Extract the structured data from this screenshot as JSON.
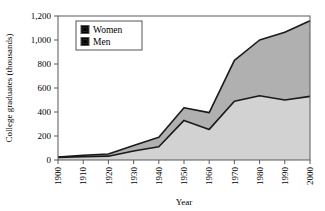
{
  "chart_data": {
    "type": "area",
    "stacked": true,
    "title": "",
    "xlabel": "Year",
    "ylabel": "College graduates (thousands)",
    "categories": [
      1900,
      1910,
      1920,
      1930,
      1940,
      1950,
      1960,
      1970,
      1980,
      1990,
      2000
    ],
    "xtick_labels": [
      "1900",
      "1910",
      "1920",
      "1930",
      "1940",
      "1950",
      "1960",
      "1970",
      "1980",
      "1990",
      "2000"
    ],
    "ytick_labels": [
      "0",
      "200",
      "400",
      "600",
      "800",
      "1,000",
      "1,200"
    ],
    "ytick_values": [
      0,
      200,
      400,
      600,
      800,
      1000,
      1200
    ],
    "xlim": [
      1900,
      2000
    ],
    "ylim": [
      0,
      1200
    ],
    "grid": false,
    "legend_position": "upper-left-inside",
    "series": [
      {
        "name": "Men",
        "color": "#d2d2d2",
        "values": [
          22,
          28,
          32,
          75,
          110,
          330,
          255,
          490,
          535,
          500,
          530
        ]
      },
      {
        "name": "Women",
        "color": "#b0b0b0",
        "values": [
          3,
          12,
          18,
          45,
          80,
          105,
          140,
          340,
          465,
          565,
          630
        ]
      }
    ],
    "totals": [
      25,
      40,
      50,
      120,
      190,
      435,
      395,
      830,
      1000,
      1065,
      1160
    ],
    "outline_color": "#1a1a1a"
  },
  "legend": {
    "entries": [
      {
        "label": "Women",
        "swatch_color": "#b0b0b0"
      },
      {
        "label": "Men",
        "swatch_color": "#d2d2d2"
      }
    ]
  },
  "axes": {
    "x_title": "Year",
    "y_title": "College graduates (thousands)"
  }
}
